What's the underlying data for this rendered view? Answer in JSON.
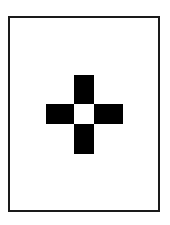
{
  "card": {
    "label": "Stimulus card",
    "border_color": "#1a1a1a",
    "background_color": "#ffffff"
  },
  "figure": {
    "shape": "cross",
    "fill_color": "#000000",
    "center_color": "#ffffff",
    "grid": {
      "rows": 3,
      "cols": 3,
      "cells": [
        {
          "row": 0,
          "col": 1,
          "filled": true,
          "name": "top-arm"
        },
        {
          "row": 1,
          "col": 0,
          "filled": true,
          "name": "left-arm"
        },
        {
          "row": 1,
          "col": 1,
          "filled": false,
          "name": "center-square"
        },
        {
          "row": 1,
          "col": 2,
          "filled": true,
          "name": "right-arm"
        },
        {
          "row": 2,
          "col": 1,
          "filled": true,
          "name": "bottom-arm"
        }
      ]
    }
  }
}
